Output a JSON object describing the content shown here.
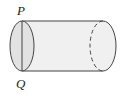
{
  "diagram": {
    "type": "cylinder",
    "labels": {
      "top_point": "P",
      "bottom_point": "Q"
    },
    "colors": {
      "stroke": "#444444",
      "body_fill": "#f0f0f0",
      "end_fill": "#e2e2e2",
      "label": "#222222"
    }
  }
}
